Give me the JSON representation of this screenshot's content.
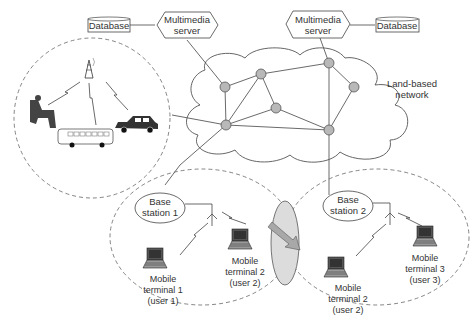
{
  "diagram": {
    "servers": [
      {
        "label_line1": "Multimedia",
        "label_line2": "server",
        "database_label": "Database"
      },
      {
        "label_line1": "Multimedia",
        "label_line2": "server",
        "database_label": "Database"
      }
    ],
    "network": {
      "label_line1": "Land-based",
      "label_line2": "network",
      "node_color": "#b8b8b8",
      "node_count": 7
    },
    "cell_left": {
      "description": "broadcast cell with tower, person, bus and car"
    },
    "base_stations": [
      {
        "label_line1": "Base",
        "label_line2": "station 1"
      },
      {
        "label_line1": "Base",
        "label_line2": "station 2"
      }
    ],
    "terminals": [
      {
        "line1": "Mobile",
        "line2": "terminal 1",
        "line3": "(user 1)"
      },
      {
        "line1": "Mobile",
        "line2": "terminal 2",
        "line3": "(user 2)"
      },
      {
        "line1": "Mobile",
        "line2": "terminal 2",
        "line3": "(user 2)"
      },
      {
        "line1": "Mobile",
        "line2": "terminal 3",
        "line3": "(user 3)"
      }
    ],
    "handover": {
      "description": "handover region with arrow from cell 1 to cell 2",
      "fill": "#dcdcdc",
      "arrow_fill": "#a8a8a8"
    }
  }
}
